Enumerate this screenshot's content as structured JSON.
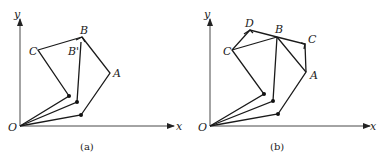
{
  "figure": {
    "panels": [
      {
        "id": "a",
        "caption": "(a)",
        "axis_labels": {
          "x": "x",
          "y": "y",
          "origin": "O"
        },
        "point_labels": {
          "B": "B",
          "B_prime": "B'",
          "C": "C",
          "A": "A"
        }
      },
      {
        "id": "b",
        "caption": "(b)",
        "axis_labels": {
          "x": "x",
          "y": "y",
          "origin": "O"
        },
        "point_labels": {
          "D": "D",
          "B": "B",
          "C_left": "C",
          "C_right": "C",
          "A": "A"
        }
      }
    ]
  }
}
